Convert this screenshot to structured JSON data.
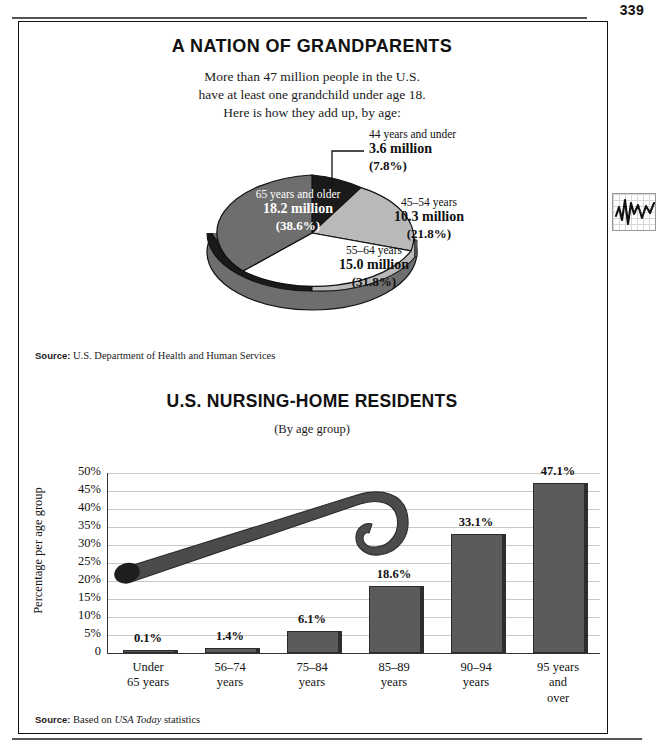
{
  "page": {
    "number": "339"
  },
  "margin": {
    "icon_name": "line-chart-icon"
  },
  "pie_figure": {
    "title": "A NATION OF GRANDPARENTS",
    "subtitle_lines": [
      "More than 47 million people in the U.S.",
      "have at least one grandchild under age 18.",
      "Here is how they add up, by age:"
    ],
    "source_label": "Source:",
    "source_text": "U.S. Department of Health and Human Services"
  },
  "bar_figure": {
    "title": "U.S. NURSING-HOME RESIDENTS",
    "subtitle": "(By age group)",
    "y_axis_title": "Percentage per age group",
    "source_label": "Source:",
    "source_prefix": "Based on ",
    "source_italic": "USA Today",
    "source_suffix": " statistics"
  },
  "chart_data": [
    {
      "type": "pie",
      "title": "A NATION OF GRANDPARENTS",
      "subtitle": "More than 47 million people in the U.S. have at least one grandchild under age 18. Here is how they add up, by age:",
      "unit": "million",
      "legend": "labels-on-slices",
      "slices": [
        {
          "label": "44 years and under",
          "value": "3.6 million",
          "value_num": 3.6,
          "percent": "(7.8%)",
          "percent_num": 7.8,
          "color": "#1a1a1a",
          "text_color": "#111111"
        },
        {
          "label": "45–54 years",
          "value": "10.3 million",
          "value_num": 10.3,
          "percent": "(21.8%)",
          "percent_num": 21.8,
          "color": "#b9b9b9",
          "text_color": "#111111"
        },
        {
          "label": "55–64 years",
          "value": "15.0 million",
          "value_num": 15.0,
          "percent": "(31.8%)",
          "percent_num": 31.8,
          "color": "#ffffff",
          "text_color": "#111111"
        },
        {
          "label": "65 years and older",
          "value": "18.2 million",
          "value_num": 18.2,
          "percent": "(38.6%)",
          "percent_num": 38.6,
          "color": "#6e6e6e",
          "text_color": "#ffffff"
        }
      ]
    },
    {
      "type": "bar",
      "title": "U.S. NURSING-HOME RESIDENTS",
      "subtitle": "(By age group)",
      "xlabel": "",
      "ylabel": "Percentage per age group",
      "ylim": [
        0,
        50
      ],
      "grid": true,
      "ytick_labels": [
        "50%",
        "45%",
        "40%",
        "35%",
        "30%",
        "25%",
        "20%",
        "15%",
        "10%",
        "5%",
        "0"
      ],
      "ytick_values": [
        50,
        45,
        40,
        35,
        30,
        25,
        20,
        15,
        10,
        5,
        0
      ],
      "categories": [
        "Under 65 years",
        "56–74 years",
        "75–84 years",
        "85–89 years",
        "90–94 years",
        "95 years and over"
      ],
      "category_lines": [
        [
          "Under",
          "65 years"
        ],
        [
          "56–74",
          "years"
        ],
        [
          "75–84",
          "years"
        ],
        [
          "85–89",
          "years"
        ],
        [
          "90–94",
          "years"
        ],
        [
          "95 years",
          "and",
          "over"
        ]
      ],
      "values": [
        0.1,
        1.4,
        6.1,
        18.6,
        33.1,
        47.1
      ],
      "value_labels": [
        "0.1%",
        "1.4%",
        "6.1%",
        "18.6%",
        "33.1%",
        "47.1%"
      ],
      "bar_color": "#5b5b5b",
      "annotation": "walking-cane-illustration"
    }
  ]
}
